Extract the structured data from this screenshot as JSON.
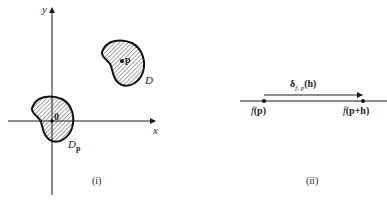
{
  "panel_i": {
    "axis_x_label": "x",
    "axis_y_label": "y",
    "region_label": "D",
    "point_label": "p",
    "origin_label": "0",
    "shifted_region_label": "D",
    "shifted_region_subscript": "p",
    "caption": "(i)"
  },
  "panel_ii": {
    "arrow_label_main": "δ",
    "arrow_label_subscript": "f, p",
    "arrow_label_arg": "(h)",
    "left_point_label_f": "f",
    "left_point_label_arg": "(p)",
    "right_point_label_f": "f",
    "right_point_label_arg": "(p+h)",
    "caption": "(ii)"
  },
  "colors": {
    "ink": "#1a1a1a",
    "background": "#ffffff"
  }
}
